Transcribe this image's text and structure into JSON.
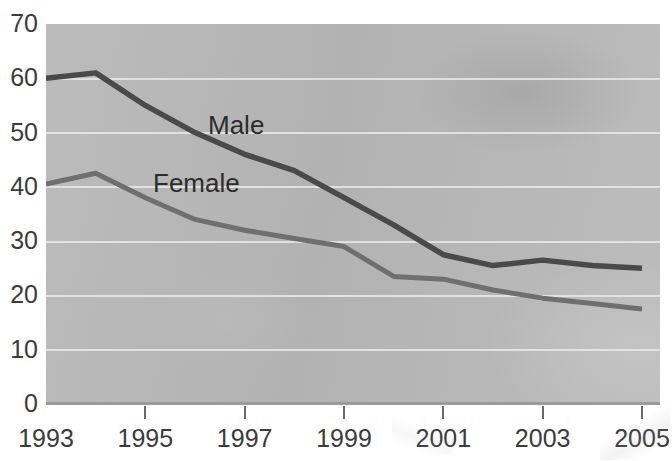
{
  "figure": {
    "title_remnant": "",
    "background_color": "#ffffff",
    "plot_background_color": "#b8b8b8",
    "gridline_color": "#e9e9e9",
    "axis_color": "#9b9b9b"
  },
  "axes": {
    "y_ticks": [
      "70",
      "60",
      "50",
      "40",
      "30",
      "20",
      "10",
      "0"
    ],
    "x_ticks": [
      "1993",
      "1995",
      "1997",
      "1999",
      "2001",
      "2003",
      "2005"
    ]
  },
  "labels": {
    "male": "Male",
    "female": "Female"
  },
  "chart_data": {
    "type": "line",
    "title": "",
    "subtitle": "",
    "xlabel": "",
    "ylabel": "",
    "xlim": [
      1993,
      2005
    ],
    "ylim": [
      0,
      70
    ],
    "ytick_values": [
      0,
      10,
      20,
      30,
      40,
      50,
      60,
      70
    ],
    "xtick_values": [
      1993,
      1995,
      1997,
      1999,
      2001,
      2003,
      2005
    ],
    "grid": "horizontal",
    "legend": "inline-labels",
    "x": [
      1993,
      1994,
      1995,
      1996,
      1997,
      1998,
      1999,
      2000,
      2001,
      2002,
      2003,
      2004,
      2005
    ],
    "series": [
      {
        "name": "Male",
        "color": "#4a4a4a",
        "label_position": "inline",
        "values": [
          60,
          61,
          55,
          50,
          46,
          43,
          38,
          33,
          27.5,
          25.5,
          26.5,
          25.5,
          25
        ]
      },
      {
        "name": "Female",
        "color": "#6f6f6f",
        "label_position": "inline",
        "values": [
          40.5,
          42.5,
          38,
          34,
          32,
          30.5,
          29,
          23.5,
          23,
          21,
          19.5,
          18.5,
          17.5
        ]
      }
    ]
  }
}
